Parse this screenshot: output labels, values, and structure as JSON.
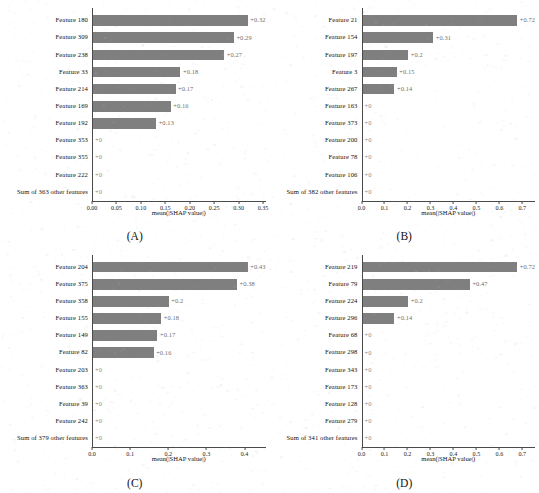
{
  "figure": {
    "background": "#ffffff",
    "bar_color": "#7f7f7f",
    "axis_color": "#4a4a4a",
    "value_label_color": "#6e6e6e"
  },
  "chart_data": [
    {
      "type": "bar",
      "orientation": "horizontal",
      "panel": "(A)",
      "title": "",
      "xlabel": "mean(|SHAP value|)",
      "ylabel": "",
      "xlim": [
        0.0,
        0.355
      ],
      "xticks": [
        0.0,
        0.05,
        0.1,
        0.15,
        0.2,
        0.25,
        0.3,
        0.35
      ],
      "xticklabels": [
        "0.00",
        "0.05",
        "0.10",
        "0.15",
        "0.20",
        "0.25",
        "0.30",
        "0.35"
      ],
      "grid": false,
      "legend": "none",
      "categories": [
        "Feature 180",
        "Feature 309",
        "Feature 238",
        "Feature 33",
        "Feature 214",
        "Feature 169",
        "Feature 192",
        "Feature 353",
        "Feature 355",
        "Feature 222",
        "Sum of 363 other features"
      ],
      "values": [
        0.32,
        0.29,
        0.27,
        0.18,
        0.17,
        0.16,
        0.13,
        0,
        0,
        0,
        0
      ],
      "value_labels": [
        "+0.32",
        "+0.29",
        "+0.27",
        "+0.18",
        "+0.17",
        "+0.16",
        "+0.13",
        "+0",
        "+0",
        "+0",
        "+0"
      ]
    },
    {
      "type": "bar",
      "orientation": "horizontal",
      "panel": "(B)",
      "title": "",
      "xlabel": "mean(|SHAP value|)",
      "ylabel": "",
      "xlim": [
        0.0,
        0.755
      ],
      "xticks": [
        0.0,
        0.1,
        0.2,
        0.3,
        0.4,
        0.5,
        0.6,
        0.7
      ],
      "xticklabels": [
        "0.0",
        "0.1",
        "0.2",
        "0.3",
        "0.4",
        "0.5",
        "0.6",
        "0.7"
      ],
      "grid": false,
      "legend": "none",
      "categories": [
        "Feature 21",
        "Feature 154",
        "Feature 197",
        "Feature 3",
        "Feature 267",
        "Feature 163",
        "Feature 373",
        "Feature 200",
        "Feature 78",
        "Feature 106",
        "Sum of 382 other features"
      ],
      "values": [
        0.72,
        0.31,
        0.2,
        0.15,
        0.14,
        0,
        0,
        0,
        0,
        0,
        0
      ],
      "value_labels": [
        "+0.72",
        "+0.31",
        "+0.2",
        "+0.15",
        "+0.14",
        "+0",
        "+0",
        "+0",
        "+0",
        "+0",
        "+0"
      ]
    },
    {
      "type": "bar",
      "orientation": "horizontal",
      "panel": "(C)",
      "title": "",
      "xlabel": "mean(|SHAP value|)",
      "ylabel": "",
      "xlim": [
        0.0,
        0.455
      ],
      "xticks": [
        0.0,
        0.1,
        0.2,
        0.3,
        0.4
      ],
      "xticklabels": [
        "0.0",
        "0.1",
        "0.2",
        "0.3",
        "0.4"
      ],
      "grid": false,
      "legend": "none",
      "categories": [
        "Feature 204",
        "Feature 375",
        "Feature 358",
        "Feature 155",
        "Feature 149",
        "Feature 82",
        "Feature 203",
        "Feature 363",
        "Feature 39",
        "Feature 242",
        "Sum of 379 other features"
      ],
      "values": [
        0.43,
        0.38,
        0.2,
        0.18,
        0.17,
        0.16,
        0,
        0,
        0,
        0,
        0
      ],
      "value_labels": [
        "+0.43",
        "+0.38",
        "+0.2",
        "+0.18",
        "+0.17",
        "+0.16",
        "+0",
        "+0",
        "+0",
        "+0",
        "+0"
      ]
    },
    {
      "type": "bar",
      "orientation": "horizontal",
      "panel": "(D)",
      "title": "",
      "xlabel": "mean(|SHAP value|)",
      "ylabel": "",
      "xlim": [
        0.0,
        0.755
      ],
      "xticks": [
        0.0,
        0.1,
        0.2,
        0.3,
        0.4,
        0.5,
        0.6,
        0.7
      ],
      "xticklabels": [
        "0.0",
        "0.1",
        "0.2",
        "0.3",
        "0.4",
        "0.5",
        "0.6",
        "0.7"
      ],
      "grid": false,
      "legend": "none",
      "categories": [
        "Feature 219",
        "Feature 79",
        "Feature 224",
        "Feature 296",
        "Feature 68",
        "Feature 298",
        "Feature 343",
        "Feature 173",
        "Feature 128",
        "Feature 279",
        "Sum of 341 other features"
      ],
      "values": [
        0.72,
        0.47,
        0.2,
        0.14,
        0,
        0,
        0,
        0,
        0,
        0,
        0
      ],
      "value_labels": [
        "+0.72",
        "+0.47",
        "+0.2",
        "+0.14",
        "+0",
        "+0",
        "+0",
        "+0",
        "+0",
        "+0",
        "+0"
      ]
    }
  ]
}
